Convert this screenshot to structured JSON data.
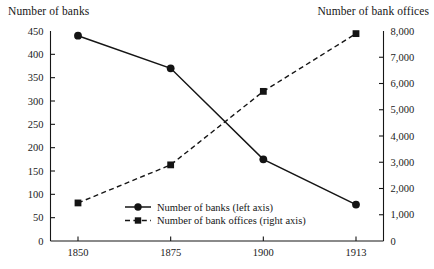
{
  "figure": {
    "left_axis_caption": "Number of banks",
    "right_axis_caption": "Number of bank offices"
  },
  "legend": {
    "items": [
      {
        "label": "Number of banks (left axis)",
        "marker": "circle-marker",
        "line": "solid"
      },
      {
        "label": "Number of bank offices (right axis)",
        "marker": "square-marker",
        "line": "dashed"
      }
    ]
  },
  "chart_data": {
    "type": "line",
    "title": "",
    "xlabel": "",
    "ylabel": "Number of banks",
    "y2label": "Number of bank offices",
    "grid": false,
    "legend_position": "inside-bottom-center",
    "categories": [
      "1850",
      "1875",
      "1900",
      "1913"
    ],
    "x": [
      1850,
      1875,
      1900,
      1913
    ],
    "x_tick_labels": [
      "1850",
      "1875",
      "1900",
      "1913"
    ],
    "ylim": [
      0,
      450
    ],
    "y_tick_labels": [
      "0",
      "50",
      "100",
      "150",
      "200",
      "250",
      "300",
      "350",
      "400",
      "450"
    ],
    "y_ticks": [
      0,
      50,
      100,
      150,
      200,
      250,
      300,
      350,
      400,
      450
    ],
    "y2lim": [
      0,
      8000
    ],
    "y2_tick_labels": [
      "0",
      "1,000",
      "2,000",
      "3,000",
      "4,000",
      "5,000",
      "6,000",
      "7,000",
      "8,000"
    ],
    "y2_ticks": [
      0,
      1000,
      2000,
      3000,
      4000,
      5000,
      6000,
      7000,
      8000
    ],
    "series": [
      {
        "name": "Number of banks (left axis)",
        "axis": "left",
        "style": "solid",
        "marker": "circle",
        "values": [
          440,
          370,
          175,
          78
        ]
      },
      {
        "name": "Number of bank offices (right axis)",
        "axis": "right",
        "style": "dashed",
        "marker": "square",
        "values": [
          1450,
          2900,
          5700,
          7900
        ]
      }
    ]
  }
}
